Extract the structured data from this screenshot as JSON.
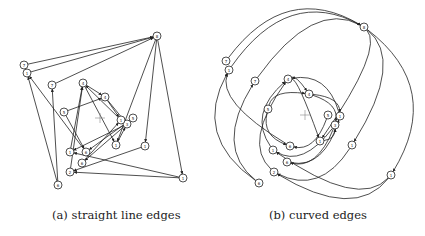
{
  "figure": {
    "subfigures": [
      {
        "id": "a",
        "caption": "(a) straight line edges",
        "edge_style": "straight",
        "center_marker": [
          100,
          118
        ],
        "nodes": [
          {
            "id": "n0",
            "label": "8",
            "x": 157,
            "y": 36
          },
          {
            "id": "n1",
            "label": "7",
            "x": 24,
            "y": 65
          },
          {
            "id": "n2",
            "label": "1",
            "x": 27,
            "y": 73
          },
          {
            "id": "n3",
            "label": "7",
            "x": 52,
            "y": 85
          },
          {
            "id": "n4",
            "label": "4",
            "x": 83,
            "y": 83
          },
          {
            "id": "n5",
            "label": "4",
            "x": 105,
            "y": 97
          },
          {
            "id": "n6",
            "label": "5",
            "x": 64,
            "y": 112
          },
          {
            "id": "n7",
            "label": "5",
            "x": 133,
            "y": 118
          },
          {
            "id": "n8",
            "label": "3",
            "x": 127,
            "y": 124
          },
          {
            "id": "n9",
            "label": "1",
            "x": 121,
            "y": 120
          },
          {
            "id": "n10",
            "label": "1",
            "x": 116,
            "y": 145
          },
          {
            "id": "n11",
            "label": "1",
            "x": 145,
            "y": 146
          },
          {
            "id": "n12",
            "label": "1",
            "x": 70,
            "y": 152
          },
          {
            "id": "n13",
            "label": "6",
            "x": 86,
            "y": 152
          },
          {
            "id": "n14",
            "label": "6",
            "x": 82,
            "y": 163
          },
          {
            "id": "n15",
            "label": "2",
            "x": 70,
            "y": 172
          },
          {
            "id": "n16",
            "label": "1",
            "x": 183,
            "y": 178
          },
          {
            "id": "n17",
            "label": "6",
            "x": 58,
            "y": 185
          }
        ],
        "edges": [
          [
            "n1",
            "n0"
          ],
          [
            "n2",
            "n0"
          ],
          [
            "n3",
            "n0"
          ],
          [
            "n0",
            "n11"
          ],
          [
            "n0",
            "n16"
          ],
          [
            "n0",
            "n10"
          ],
          [
            "n17",
            "n2"
          ],
          [
            "n17",
            "n3"
          ],
          [
            "n13",
            "n2"
          ],
          [
            "n6",
            "n5"
          ],
          [
            "n6",
            "n13"
          ],
          [
            "n12",
            "n4"
          ],
          [
            "n4",
            "n10"
          ],
          [
            "n4",
            "n5"
          ],
          [
            "n5",
            "n9"
          ],
          [
            "n5",
            "n8"
          ],
          [
            "n9",
            "n4"
          ],
          [
            "n8",
            "n14"
          ],
          [
            "n7",
            "n13"
          ],
          [
            "n8",
            "n12"
          ],
          [
            "n16",
            "n15"
          ],
          [
            "n11",
            "n15"
          ],
          [
            "n16",
            "n12"
          ],
          [
            "n15",
            "n4"
          ],
          [
            "n14",
            "n9"
          ],
          [
            "n10",
            "n8"
          ]
        ]
      },
      {
        "id": "b",
        "caption": "(b) curved edges",
        "edge_style": "curved",
        "center_marker": [
          305,
          115
        ],
        "nodes": [
          {
            "id": "m0",
            "label": "8",
            "x": 364,
            "y": 27
          },
          {
            "id": "m1",
            "label": "7",
            "x": 226,
            "y": 61
          },
          {
            "id": "m2",
            "label": "1",
            "x": 229,
            "y": 70
          },
          {
            "id": "m3",
            "label": "7",
            "x": 255,
            "y": 81
          },
          {
            "id": "m4",
            "label": "4",
            "x": 288,
            "y": 79
          },
          {
            "id": "m5",
            "label": "4",
            "x": 309,
            "y": 94
          },
          {
            "id": "m6",
            "label": "5",
            "x": 268,
            "y": 109
          },
          {
            "id": "m7",
            "label": "5",
            "x": 328,
            "y": 115
          },
          {
            "id": "m8",
            "label": "1",
            "x": 340,
            "y": 116
          },
          {
            "id": "m9",
            "label": "3",
            "x": 335,
            "y": 125
          },
          {
            "id": "m10",
            "label": "1",
            "x": 320,
            "y": 141
          },
          {
            "id": "m11",
            "label": "1",
            "x": 352,
            "y": 145
          },
          {
            "id": "m12",
            "label": "1",
            "x": 273,
            "y": 150
          },
          {
            "id": "m13",
            "label": "6",
            "x": 290,
            "y": 146
          },
          {
            "id": "m14",
            "label": "6",
            "x": 287,
            "y": 162
          },
          {
            "id": "m15",
            "label": "2",
            "x": 274,
            "y": 172
          },
          {
            "id": "m16",
            "label": "1",
            "x": 391,
            "y": 175
          },
          {
            "id": "m17",
            "label": "6",
            "x": 259,
            "y": 183
          }
        ],
        "edges": [
          [
            "m1",
            "m0"
          ],
          [
            "m2",
            "m0"
          ],
          [
            "m3",
            "m0"
          ],
          [
            "m0",
            "m11"
          ],
          [
            "m0",
            "m16"
          ],
          [
            "m0",
            "m10"
          ],
          [
            "m17",
            "m2"
          ],
          [
            "m17",
            "m3"
          ],
          [
            "m13",
            "m2"
          ],
          [
            "m6",
            "m5"
          ],
          [
            "m6",
            "m13"
          ],
          [
            "m12",
            "m4"
          ],
          [
            "m4",
            "m10"
          ],
          [
            "m4",
            "m5"
          ],
          [
            "m5",
            "m8"
          ],
          [
            "m5",
            "m9"
          ],
          [
            "m8",
            "m4"
          ],
          [
            "m9",
            "m14"
          ],
          [
            "m7",
            "m13"
          ],
          [
            "m9",
            "m12"
          ],
          [
            "m16",
            "m15"
          ],
          [
            "m11",
            "m15"
          ],
          [
            "m16",
            "m12"
          ],
          [
            "m15",
            "m4"
          ],
          [
            "m14",
            "m8"
          ],
          [
            "m10",
            "m9"
          ]
        ]
      }
    ]
  }
}
